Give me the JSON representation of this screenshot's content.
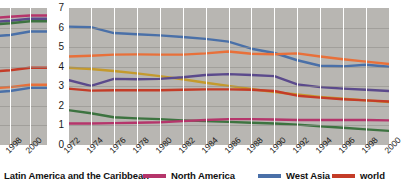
{
  "chart_data": {
    "type": "line",
    "title": "",
    "subtitle": "",
    "xlabel": "",
    "ylabel": "",
    "ylim": [
      0,
      7
    ],
    "xlim": [
      1972,
      2000
    ],
    "grid": true,
    "legend_position": "bottom",
    "yticks": [
      "7",
      "6",
      "5",
      "4",
      "3",
      "2",
      "1",
      "0"
    ],
    "ytick_values": [
      7,
      6,
      5,
      4,
      3,
      2,
      1,
      0
    ],
    "x": [
      1972,
      1974,
      1976,
      1978,
      1980,
      1982,
      1984,
      1986,
      1988,
      1990,
      1992,
      1994,
      1996,
      1998,
      2000
    ],
    "categories": [
      "1972",
      "1974",
      "1976",
      "1978",
      "1980",
      "1982",
      "1984",
      "1986",
      "1988",
      "1990",
      "1992",
      "1994",
      "1996",
      "1998",
      "2000"
    ],
    "series": [
      {
        "name": "West Asia",
        "color": "#4a70a8",
        "values": [
          6.05,
          6.02,
          5.72,
          5.66,
          5.6,
          5.52,
          5.42,
          5.28,
          4.92,
          4.7,
          4.33,
          4.05,
          4.02,
          4.1,
          4.0
        ]
      },
      {
        "name": "series-orange",
        "color": "#e8703a",
        "values": [
          4.52,
          4.56,
          4.62,
          4.63,
          4.62,
          4.62,
          4.68,
          4.78,
          4.66,
          4.64,
          4.68,
          4.52,
          4.38,
          4.26,
          4.14
        ]
      },
      {
        "name": "series-gold",
        "color": "#c49a2e",
        "values": [
          3.95,
          3.88,
          3.78,
          3.66,
          3.52,
          3.36,
          3.18,
          3.02,
          2.86,
          2.7,
          2.58,
          2.46,
          2.36,
          2.28,
          2.2
        ]
      },
      {
        "name": "series-purple",
        "color": "#5b4a8c",
        "values": [
          3.32,
          3.02,
          3.38,
          3.36,
          3.38,
          3.46,
          3.58,
          3.62,
          3.58,
          3.52,
          3.1,
          2.96,
          2.88,
          2.82,
          2.76
        ]
      },
      {
        "name": "world",
        "color": "#c43c28",
        "values": [
          2.88,
          2.78,
          2.8,
          2.8,
          2.8,
          2.82,
          2.84,
          2.84,
          2.82,
          2.76,
          2.52,
          2.42,
          2.34,
          2.28,
          2.22
        ]
      },
      {
        "name": "series-green",
        "color": "#3d7340",
        "values": [
          1.78,
          1.62,
          1.42,
          1.36,
          1.32,
          1.26,
          1.22,
          1.18,
          1.14,
          1.1,
          1.04,
          0.96,
          0.88,
          0.8,
          0.72
        ]
      },
      {
        "name": "Latin America and the Caribbean",
        "color": "#b5356b",
        "values": [
          1.1,
          1.1,
          1.12,
          1.14,
          1.16,
          1.22,
          1.28,
          1.32,
          1.32,
          1.3,
          1.28,
          1.28,
          1.28,
          1.28,
          1.26
        ]
      }
    ],
    "left_panel": {
      "categories": [
        "1998",
        "2000"
      ],
      "note": "clipped preceding chart panel",
      "series": [
        {
          "name": "clip-magenta",
          "color": "#b5356b",
          "values": [
            6.55,
            6.62
          ]
        },
        {
          "name": "clip-purple",
          "color": "#5b4a8c",
          "values": [
            6.35,
            6.45
          ]
        },
        {
          "name": "clip-green",
          "color": "#3d7340",
          "values": [
            6.22,
            6.32
          ]
        },
        {
          "name": "clip-blue",
          "color": "#4a70a8",
          "values": [
            5.62,
            5.8
          ]
        },
        {
          "name": "clip-red",
          "color": "#c43c28",
          "values": [
            3.82,
            3.95
          ]
        },
        {
          "name": "clip-orange",
          "color": "#e8703a",
          "values": [
            2.96,
            3.08
          ]
        },
        {
          "name": "clip-navy",
          "color": "#4a70a8",
          "values": [
            2.76,
            2.92
          ]
        }
      ]
    },
    "legend": [
      {
        "label": "Latin America and the Caribbean",
        "color": "#b5356b"
      },
      {
        "label": "North America",
        "color": "#b5356b"
      },
      {
        "label": "West Asia",
        "color": "#4a70a8"
      },
      {
        "label": "world",
        "color": "#c43c28"
      }
    ]
  },
  "colors": {
    "plot_background": "#b8b6b2",
    "gridline": "#ffffff",
    "text": "#1a1a1a"
  }
}
